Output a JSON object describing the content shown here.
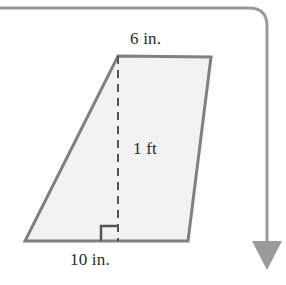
{
  "figure": {
    "kind": "geometry-diagram",
    "shape": "trapezoid",
    "colors": {
      "outline": "#808080",
      "fill": "#f2f2f2",
      "dashed_line": "#555555",
      "text": "#2b2b2b",
      "flow_arrow": "#9a9a9a",
      "background": "#ffffff"
    },
    "labels": {
      "top_side": "6 in.",
      "height": "1 ft",
      "bottom_side": "10 in."
    },
    "right_angle_mark": {
      "present": true,
      "at": "base-of-height"
    },
    "vertices": {
      "top_left": [
        118,
        56
      ],
      "top_right": [
        211,
        57
      ],
      "bottom_right": [
        188,
        241
      ],
      "bottom_left": [
        25,
        241
      ]
    },
    "dashed_height": {
      "from": [
        118,
        56
      ],
      "to": [
        118,
        241
      ]
    }
  },
  "flow_arrow": {
    "name": "page-flow-arrow",
    "direction": "down",
    "path": "horizontal from left edge, rounded corner at top right, then vertical down to arrowhead",
    "corner_radius": 18,
    "arrowhead": "down-triangle"
  }
}
